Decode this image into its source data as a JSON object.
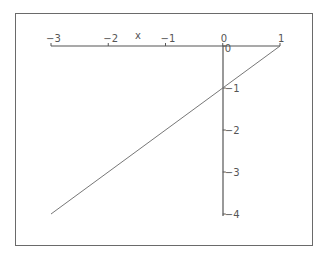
{
  "chart_data": {
    "type": "line",
    "title": "",
    "xlabel": "x",
    "ylabel": "",
    "xlim": [
      -3,
      1
    ],
    "ylim": [
      -4,
      0
    ],
    "grid": false,
    "legend": null,
    "x_ticks": [
      "-3",
      "-2",
      "-1",
      "0",
      "1"
    ],
    "y_ticks": [
      "0",
      "-1",
      "-2",
      "-3",
      "-4"
    ],
    "series": [
      {
        "name": "y = x - 1",
        "x": [
          -3,
          1
        ],
        "y": [
          -4,
          0
        ],
        "color": "#777777"
      }
    ]
  },
  "colors": {
    "frame": "#6a6a6a",
    "axis": "#555555",
    "curve": "#777777",
    "text": "#555555"
  }
}
